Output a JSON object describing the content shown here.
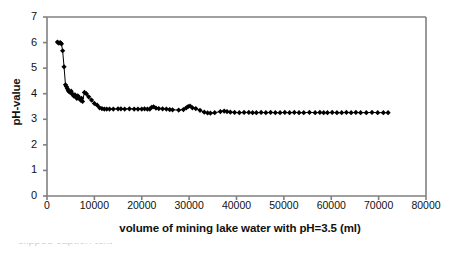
{
  "chart_data": {
    "type": "line",
    "title": "",
    "xlabel": "volume of mining lake water with pH=3.5 (ml)",
    "ylabel": "pH-value",
    "xlim": [
      0,
      80000
    ],
    "ylim": [
      0,
      7
    ],
    "xticks": [
      "0",
      "10000",
      "20000",
      "30000",
      "40000",
      "50000",
      "60000",
      "70000",
      "80000"
    ],
    "xtick_values": [
      0,
      10000,
      20000,
      30000,
      40000,
      50000,
      60000,
      70000,
      80000
    ],
    "yticks": [
      "0",
      "1",
      "2",
      "3",
      "4",
      "5",
      "6",
      "7"
    ],
    "ytick_values": [
      0,
      1,
      2,
      3,
      4,
      5,
      6,
      7
    ],
    "grid": false,
    "legend": false,
    "marker": "filled-diamond",
    "marker_color": "#000000",
    "line_color": "#000000",
    "axis_color": "#808080",
    "series": [
      {
        "name": "titration curve",
        "x": [
          2200,
          2500,
          2800,
          3050,
          3300,
          3600,
          3900,
          4100,
          4300,
          4500,
          4700,
          4900,
          5100,
          5300,
          5500,
          5700,
          5900,
          6100,
          6300,
          6500,
          6700,
          6900,
          7100,
          7300,
          7500,
          7900,
          8300,
          8800,
          9400,
          10000,
          10600,
          11100,
          11600,
          12100,
          12600,
          13200,
          14000,
          15000,
          15600,
          16400,
          17400,
          18400,
          19200,
          20000,
          20600,
          21200,
          21700,
          22100,
          22500,
          23000,
          23600,
          24400,
          25200,
          25900,
          26500,
          27800,
          28800,
          29400,
          29800,
          30200,
          30700,
          31400,
          32300,
          33200,
          33900,
          34500,
          35400,
          36600,
          37400,
          38000,
          38700,
          39600,
          40600,
          41600,
          42600,
          43400,
          44200,
          45200,
          46200,
          47200,
          48200,
          49200,
          50200,
          51200,
          52200,
          53200,
          54200,
          55400,
          56600,
          57600,
          58400,
          59200,
          60200,
          61200,
          62200,
          63200,
          64200,
          65200,
          66200,
          67400,
          68600,
          69800,
          71000,
          72000
        ],
        "y": [
          6.02,
          5.98,
          6.0,
          5.95,
          5.68,
          5.05,
          4.35,
          4.28,
          4.2,
          4.12,
          4.08,
          4.05,
          4.1,
          4.0,
          3.95,
          3.9,
          3.96,
          3.88,
          3.82,
          3.92,
          3.86,
          3.8,
          3.75,
          3.82,
          3.7,
          4.05,
          4.0,
          3.88,
          3.75,
          3.62,
          3.55,
          3.45,
          3.42,
          3.4,
          3.4,
          3.4,
          3.4,
          3.41,
          3.41,
          3.4,
          3.41,
          3.4,
          3.4,
          3.4,
          3.41,
          3.4,
          3.4,
          3.47,
          3.49,
          3.44,
          3.42,
          3.41,
          3.4,
          3.38,
          3.37,
          3.36,
          3.38,
          3.45,
          3.5,
          3.52,
          3.45,
          3.42,
          3.35,
          3.28,
          3.25,
          3.24,
          3.26,
          3.3,
          3.32,
          3.3,
          3.28,
          3.27,
          3.26,
          3.27,
          3.27,
          3.26,
          3.26,
          3.27,
          3.26,
          3.27,
          3.26,
          3.26,
          3.27,
          3.26,
          3.27,
          3.26,
          3.26,
          3.27,
          3.26,
          3.27,
          3.26,
          3.26,
          3.27,
          3.26,
          3.26,
          3.27,
          3.26,
          3.27,
          3.26,
          3.26,
          3.27,
          3.26,
          3.26,
          3.26
        ]
      }
    ]
  },
  "caption": {
    "clipped_text": "clipped caption text"
  }
}
